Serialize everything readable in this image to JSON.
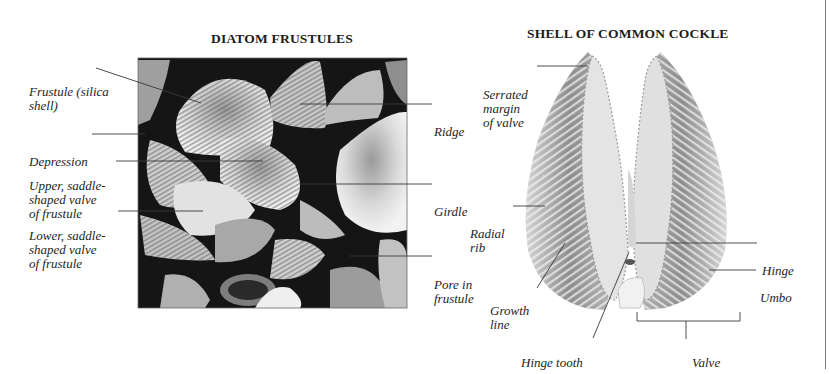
{
  "figures": [
    {
      "id": "diatom",
      "title": "DIATOM FRUSTULES",
      "image": "scanning-electron-micrograph-diatom-frustules",
      "labels": [
        {
          "key": "frustule",
          "lines": [
            "Frustule (silica",
            "shell)"
          ]
        },
        {
          "key": "depression",
          "lines": [
            "Depression"
          ]
        },
        {
          "key": "upper_valve",
          "lines": [
            "Upper, saddle-",
            "shaped valve",
            "of frustule"
          ]
        },
        {
          "key": "lower_valve",
          "lines": [
            "Lower, saddle-",
            "shaped valve",
            "of frustule"
          ]
        },
        {
          "key": "ridge",
          "lines": [
            "Ridge"
          ]
        },
        {
          "key": "girdle",
          "lines": [
            "Girdle"
          ]
        },
        {
          "key": "pore",
          "lines": [
            "Pore in",
            "frustule"
          ]
        }
      ]
    },
    {
      "id": "cockle",
      "title": "SHELL OF COMMON COCKLE",
      "image": "open-cockle-shell-two-valves",
      "labels": [
        {
          "key": "serrated",
          "lines": [
            "Serrated",
            "margin",
            "of valve"
          ]
        },
        {
          "key": "radial_rib",
          "lines": [
            "Radial",
            "rib"
          ]
        },
        {
          "key": "growth_line",
          "lines": [
            "Growth",
            "line"
          ]
        },
        {
          "key": "hinge_tooth",
          "lines": [
            "Hinge tooth"
          ]
        },
        {
          "key": "hinge",
          "lines": [
            "Hinge"
          ]
        },
        {
          "key": "umbo",
          "lines": [
            "Umbo"
          ]
        },
        {
          "key": "valve",
          "lines": [
            "Valve"
          ]
        }
      ]
    }
  ],
  "colors": {
    "leader_line": "#3a3a3a",
    "photo_dark": "#151515",
    "shell_light": "#e8e8e8",
    "shell_rib": "#8a8a8a"
  }
}
